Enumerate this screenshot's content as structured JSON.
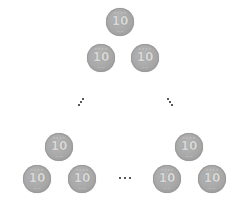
{
  "diagram": {
    "coin": {
      "value_label": "10",
      "color": "#a8a8a8"
    },
    "coins": [
      {
        "id": "apex",
        "x": 106,
        "y": 8
      },
      {
        "id": "row2-left",
        "x": 87,
        "y": 44
      },
      {
        "id": "row2-right",
        "x": 131,
        "y": 44
      },
      {
        "id": "left-group-top",
        "x": 45,
        "y": 133
      },
      {
        "id": "left-group-bottom-left",
        "x": 23,
        "y": 165
      },
      {
        "id": "left-group-bottom-right",
        "x": 68,
        "y": 165
      },
      {
        "id": "right-group-top",
        "x": 175,
        "y": 133
      },
      {
        "id": "right-group-bottom-left",
        "x": 153,
        "y": 165
      },
      {
        "id": "right-group-bottom-right",
        "x": 198,
        "y": 165
      }
    ],
    "ellipses": {
      "left_diagonal": "⋰",
      "right_diagonal": "⋱",
      "bottom_horizontal": "…"
    }
  }
}
